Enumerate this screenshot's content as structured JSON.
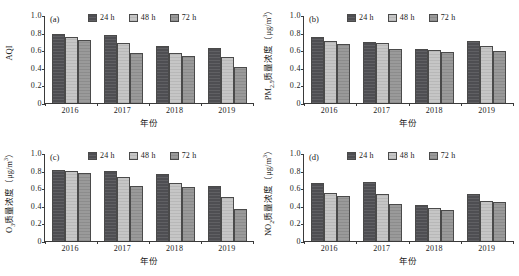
{
  "figure": {
    "panels": [
      "a",
      "b",
      "c",
      "d"
    ],
    "shared": {
      "xlabel": "年份",
      "categories": [
        "2016",
        "2017",
        "2018",
        "2019"
      ],
      "yticks": [
        "1.0",
        "0.8",
        "0.6",
        "0.4",
        "0.2",
        "0"
      ],
      "legend": [
        "24 h",
        "48 h",
        "72 h"
      ],
      "colors": {
        "series_24h": "#4e4e52",
        "series_48h": "#c6c6c6",
        "series_72h": "#9a9a9a",
        "axis": "#3a3a3a",
        "background": "#ffffff"
      }
    }
  },
  "chart_data": [
    {
      "type": "bar",
      "panel_tag": "(a)",
      "title": "",
      "xlabel": "年份",
      "ylabel": "AQI",
      "ylim": [
        0,
        1.0
      ],
      "ytick_values": [
        1.0,
        0.8,
        0.6,
        0.4,
        0.2,
        0
      ],
      "ytick_labels": [
        "1.0",
        "0.8",
        "0.6",
        "0.4",
        "0.2",
        "0"
      ],
      "categories": [
        "2016",
        "2017",
        "2018",
        "2019"
      ],
      "grid": false,
      "legend_position": "top-right",
      "series": [
        {
          "name": "24 h",
          "values": [
            0.785,
            0.775,
            0.645,
            0.62
          ]
        },
        {
          "name": "48 h",
          "values": [
            0.748,
            0.685,
            0.565,
            0.522
          ]
        },
        {
          "name": "72 h",
          "values": [
            0.72,
            0.572,
            0.537,
            0.408
          ]
        }
      ]
    },
    {
      "type": "bar",
      "panel_tag": "(b)",
      "title": "",
      "xlabel": "年份",
      "ylabel": "PM2.5质量浓度（μg/m3）",
      "ylim": [
        0,
        1.0
      ],
      "ytick_values": [
        1.0,
        0.8,
        0.6,
        0.4,
        0.2,
        0
      ],
      "ytick_labels": [
        "1.0",
        "0.8",
        "0.6",
        "0.4",
        "0.2",
        "0"
      ],
      "categories": [
        "2016",
        "2017",
        "2018",
        "2019"
      ],
      "grid": false,
      "legend_position": "top-right",
      "series": [
        {
          "name": "24 h",
          "values": [
            0.752,
            0.697,
            0.615,
            0.7
          ]
        },
        {
          "name": "48 h",
          "values": [
            0.706,
            0.686,
            0.597,
            0.65
          ]
        },
        {
          "name": "72 h",
          "values": [
            0.675,
            0.617,
            0.582,
            0.595
          ]
        }
      ]
    },
    {
      "type": "bar",
      "panel_tag": "(c)",
      "title": "",
      "xlabel": "年份",
      "ylabel": "O3质量浓度（μg/m3）",
      "ylim": [
        0,
        1.0
      ],
      "ytick_values": [
        1.0,
        0.8,
        0.6,
        0.4,
        0.2,
        0
      ],
      "ytick_labels": [
        "1.0",
        "0.8",
        "0.6",
        "0.4",
        "0.2",
        "0"
      ],
      "categories": [
        "2016",
        "2017",
        "2018",
        "2019"
      ],
      "grid": false,
      "legend_position": "top-right",
      "series": [
        {
          "name": "24 h",
          "values": [
            0.812,
            0.795,
            0.763,
            0.627
          ]
        },
        {
          "name": "48 h",
          "values": [
            0.79,
            0.73,
            0.655,
            0.495
          ]
        },
        {
          "name": "72 h",
          "values": [
            0.768,
            0.628,
            0.61,
            0.368
          ]
        }
      ]
    },
    {
      "type": "bar",
      "panel_tag": "(d)",
      "title": "",
      "xlabel": "年份",
      "ylabel": "NO2质量浓度（μg/m3）",
      "ylim": [
        0,
        1.0
      ],
      "ytick_values": [
        1.0,
        0.8,
        0.6,
        0.4,
        0.2,
        0
      ],
      "ytick_labels": [
        "1.0",
        "0.8",
        "0.6",
        "0.4",
        "0.2",
        "0"
      ],
      "categories": [
        "2016",
        "2017",
        "2018",
        "2019"
      ],
      "grid": false,
      "legend_position": "top-right",
      "series": [
        {
          "name": "24 h",
          "values": [
            0.66,
            0.672,
            0.413,
            0.538
          ]
        },
        {
          "name": "48 h",
          "values": [
            0.54,
            0.53,
            0.375,
            0.452
          ]
        },
        {
          "name": "72 h",
          "values": [
            0.515,
            0.422,
            0.352,
            0.445
          ]
        }
      ]
    }
  ]
}
